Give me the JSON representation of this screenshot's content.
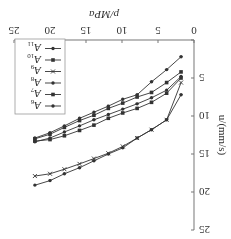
{
  "chart_data": {
    "type": "line",
    "title": "",
    "xlabel": "p/MPa",
    "ylabel": "u/(mm/s)",
    "xlim": [
      0,
      25
    ],
    "ylim": [
      0,
      25
    ],
    "x_ticks": [
      0,
      5,
      10,
      15,
      20,
      25
    ],
    "y_ticks": [
      0,
      5,
      10,
      15,
      20,
      25
    ],
    "grid": false,
    "legend_position": "lower right (as displayed rotated)",
    "orientation_note": "figure rendered rotated 180 degrees",
    "x": [
      1.8,
      3.8,
      5.9,
      7.9,
      9.9,
      11.9,
      13.9,
      15.9,
      18.0,
      20.0,
      22.1
    ],
    "series": [
      {
        "name": "A6",
        "marker": "circle",
        "values": [
          2.2,
          3.9,
          5.5,
          7.2,
          7.8,
          8.7,
          9.5,
          10.3,
          11.3,
          12.2,
          12.9
        ]
      },
      {
        "name": "A7",
        "marker": "square",
        "values": [
          4.2,
          5.6,
          6.9,
          7.5,
          8.3,
          9.0,
          9.9,
          10.6,
          11.5,
          12.4,
          13.0
        ]
      },
      {
        "name": "A8",
        "marker": "circle",
        "values": [
          4.8,
          6.6,
          7.6,
          8.4,
          9.1,
          9.8,
          10.5,
          11.3,
          12.1,
          12.9,
          13.4
        ]
      },
      {
        "name": "A9",
        "marker": "cross",
        "values": [
          5.6,
          10.5,
          11.8,
          12.9,
          14.0,
          14.9,
          15.6,
          16.3,
          17.0,
          17.6,
          17.9
        ]
      },
      {
        "name": "A10",
        "marker": "square",
        "values": [
          5.0,
          7.0,
          8.2,
          9.0,
          9.6,
          10.3,
          11.2,
          11.9,
          12.6,
          13.1,
          13.3
        ]
      },
      {
        "name": "A11",
        "marker": "circle",
        "values": [
          7.2,
          10.5,
          11.8,
          12.9,
          14.2,
          15.0,
          15.9,
          16.8,
          17.6,
          18.5,
          19.1
        ]
      }
    ],
    "extra_series_note": "one additional mid curve ends near u=16.2 (between clusters)"
  },
  "legend": {
    "items": [
      {
        "label": "A",
        "sub": "6",
        "marker": "circle"
      },
      {
        "label": "A",
        "sub": "7",
        "marker": "square"
      },
      {
        "label": "A",
        "sub": "8",
        "marker": "circle"
      },
      {
        "label": "A",
        "sub": "9",
        "marker": "cross"
      },
      {
        "label": "A",
        "sub": "10",
        "marker": "square"
      },
      {
        "label": "A",
        "sub": "11",
        "marker": "circle"
      }
    ]
  },
  "axes": {
    "x_label": "p/MPa",
    "y_label": "u/(mm/s)",
    "x_ticks": [
      "0",
      "5",
      "10",
      "15",
      "20",
      "25"
    ],
    "y_ticks": [
      "0",
      "5",
      "10",
      "15",
      "20",
      "25"
    ]
  },
  "colors": {
    "line": "#333333",
    "axis": "#777777",
    "legend_border": "#999999"
  }
}
